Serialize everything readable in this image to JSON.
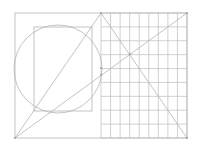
{
  "diagram": {
    "width": 198,
    "height": 156,
    "colors": {
      "background": "#ffffff",
      "stroke": "#b4b4b4",
      "grid": "#bdbdbd",
      "point": "#9a9a9a"
    },
    "outer_rect": {
      "x": 15,
      "y": 13,
      "w": 172,
      "h": 125
    },
    "inner_rect": {
      "x": 34,
      "y": 27,
      "w": 58,
      "h": 84
    },
    "circle": {
      "cx": 58,
      "cy": 69,
      "r": 44
    },
    "grid": {
      "x0": 101,
      "x1": 187,
      "y0": 13,
      "y1": 138,
      "cols": 9,
      "rows": 9
    },
    "lines": [
      {
        "name": "left-diagonal",
        "x1": 15,
        "y1": 138,
        "x2": 101,
        "y2": 13
      },
      {
        "name": "right-diagonal",
        "x1": 101,
        "y1": 13,
        "x2": 187,
        "y2": 138
      },
      {
        "name": "long-diagonal",
        "x1": 15,
        "y1": 138,
        "x2": 187,
        "y2": 13
      }
    ],
    "points": [
      {
        "x": 15,
        "y": 138
      },
      {
        "x": 101,
        "y": 13
      },
      {
        "x": 187,
        "y": 13
      },
      {
        "x": 187,
        "y": 138
      },
      {
        "x": 130,
        "y": 54
      },
      {
        "x": 101,
        "y": 75
      },
      {
        "x": 101,
        "y": 68
      }
    ]
  }
}
